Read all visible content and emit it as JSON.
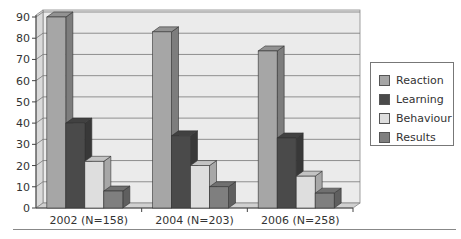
{
  "chart_data": {
    "type": "bar",
    "style": "3d-clustered-column",
    "title": "",
    "xlabel": "",
    "ylabel": "",
    "categories": [
      "2002 (N=158)",
      "2004 (N=203)",
      "2006 (N=258)"
    ],
    "series": [
      {
        "name": "Reaction",
        "color": "#a6a6a6",
        "values": [
          90,
          83,
          74
        ]
      },
      {
        "name": "Learning",
        "color": "#4a4a4a",
        "values": [
          40,
          34,
          33
        ]
      },
      {
        "name": "Behaviour",
        "color": "#dedede",
        "values": [
          22,
          20,
          15
        ]
      },
      {
        "name": "Results",
        "color": "#7f7f7f",
        "values": [
          8,
          10,
          7
        ]
      }
    ],
    "ylim": [
      0,
      90
    ],
    "yticks": [
      0,
      10,
      20,
      30,
      40,
      50,
      60,
      70,
      80,
      90
    ],
    "grid": true,
    "legend_position": "right"
  },
  "legend": {
    "items": [
      {
        "label": "Reaction",
        "color": "#a6a6a6"
      },
      {
        "label": "Learning",
        "color": "#4a4a4a"
      },
      {
        "label": "Behaviour",
        "color": "#dedede"
      },
      {
        "label": "Results",
        "color": "#7f7f7f"
      }
    ]
  }
}
